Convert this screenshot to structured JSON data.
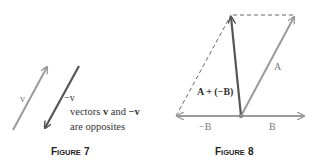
{
  "figure7": {
    "caption_first": "F",
    "caption_rest": "IGURE",
    "caption_num": "7",
    "label_v": "v",
    "label_neg_v": "−v",
    "note_line1_a": "vectors ",
    "note_line1_b": "v",
    "note_line1_c": " and ",
    "note_line1_d": "−v",
    "note_line2": "are opposites",
    "colors": {
      "v": "#9a9a9a",
      "neg_v": "#555555"
    }
  },
  "figure8": {
    "caption_first": "F",
    "caption_rest": "IGURE",
    "caption_num": "8",
    "label_A": "A",
    "label_B": "B",
    "label_negB": "−B",
    "label_sum": "A + (−B)",
    "colors": {
      "A": "#9a9a9a",
      "B": "#9a9a9a",
      "negB": "#9a9a9a",
      "sum": "#555555",
      "dashed": "#666666"
    }
  }
}
